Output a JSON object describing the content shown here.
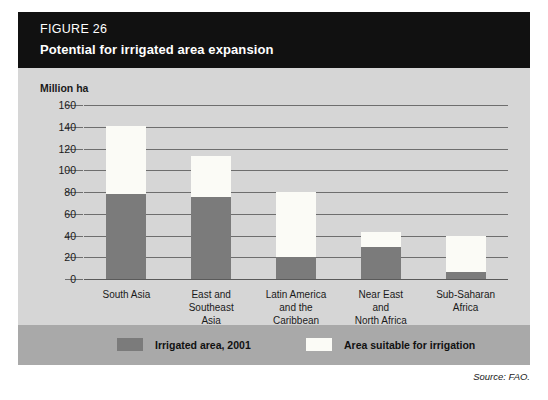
{
  "figure": {
    "label": "FIGURE 26",
    "title": "Potential for irrigated area expansion",
    "source": "Source: FAO."
  },
  "legend": {
    "items": [
      {
        "label": "Irrigated area, 2001",
        "color": "#7b7b7b",
        "swatch": "dark"
      },
      {
        "label": "Area suitable for irrigation",
        "color": "#fbfbf6",
        "swatch": "light"
      }
    ]
  },
  "colors": {
    "title_bar": "#111111",
    "panel_background": "#d6d6d6",
    "legend_band": "#a9a9a9",
    "irrigated": "#7b7b7b",
    "suitable": "#fbfbf6",
    "gridline": "#6e6e6e",
    "text": "#1a1a1a"
  },
  "chart_data": {
    "type": "bar",
    "subtype": "stacked",
    "title": "Potential for irrigated area expansion",
    "xlabel": "",
    "ylabel": "Million ha",
    "ylim": [
      0,
      160
    ],
    "yticks": [
      0,
      20,
      40,
      60,
      80,
      100,
      120,
      140,
      160
    ],
    "ytick_labels": [
      "0",
      "20",
      "40",
      "60",
      "80",
      "100",
      "120",
      "140",
      "160"
    ],
    "grid": true,
    "legend_position": "bottom",
    "categories": [
      "South Asia",
      "East and Southeast Asia",
      "Latin America and the Caribbean",
      "Near East and North Africa",
      "Sub-Saharan Africa"
    ],
    "category_lines": [
      [
        "South Asia"
      ],
      [
        "East and",
        "Southeast",
        "Asia"
      ],
      [
        "Latin America",
        "and the",
        "Caribbean"
      ],
      [
        "Near East",
        "and",
        "North Africa"
      ],
      [
        "Sub-Saharan",
        "Africa"
      ]
    ],
    "series": [
      {
        "name": "Irrigated area, 2001",
        "color": "#7b7b7b",
        "values": [
          78,
          75,
          20,
          29,
          6
        ]
      },
      {
        "name": "Area suitable for irrigation",
        "color": "#fbfbf6",
        "values": [
          63,
          38,
          60,
          14,
          34
        ]
      }
    ],
    "totals": [
      141,
      113,
      80,
      43,
      40
    ]
  }
}
